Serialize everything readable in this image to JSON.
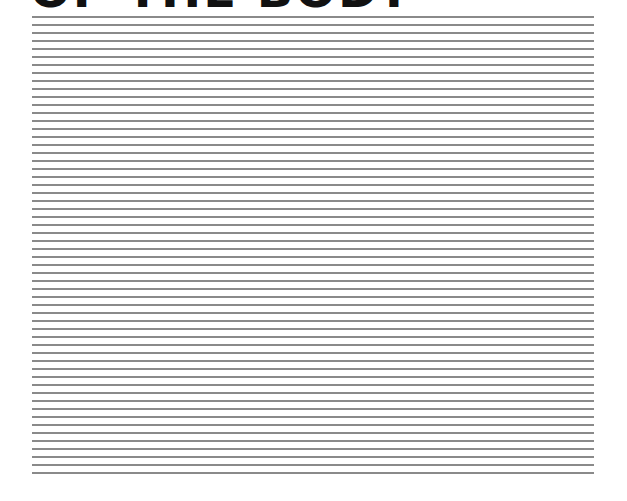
{
  "page": {
    "title": "OF THE BODY",
    "line_count": 58,
    "line_color": "#8a8a8a"
  }
}
